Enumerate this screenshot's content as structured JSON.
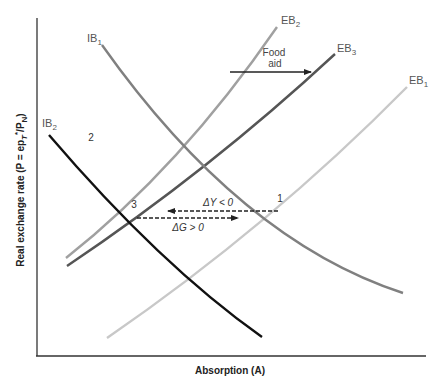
{
  "diagram": {
    "axes": {
      "x_label": "Absorption (A)",
      "y_label": "Real exchange rate (P = ep",
      "y_label_full": "Real exchange rate (P = ep_T*/P_N)"
    },
    "curves": {
      "IB1": {
        "label": "IB",
        "sub": "1",
        "color": "#808080"
      },
      "IB2": {
        "label": "IB",
        "sub": "2",
        "color": "#111111"
      },
      "EB1": {
        "label": "EB",
        "sub": "1",
        "color": "#c8c8c8"
      },
      "EB2": {
        "label": "EB",
        "sub": "2",
        "color": "#a0a0a0"
      },
      "EB3": {
        "label": "EB",
        "sub": "3",
        "color": "#555555"
      }
    },
    "points": {
      "p1": "1",
      "p2": "2",
      "p3": "3"
    },
    "annotations": {
      "food_line1": "Food",
      "food_line2": "aid",
      "delta_y": "ΔY < 0",
      "delta_g": "ΔG > 0"
    }
  }
}
